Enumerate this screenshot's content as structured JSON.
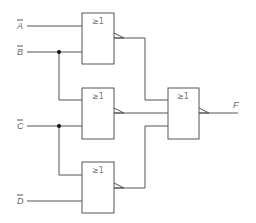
{
  "diagram": {
    "type": "logic-circuit",
    "inputs": [
      {
        "id": "A",
        "label": "A",
        "negated": true
      },
      {
        "id": "B",
        "label": "B",
        "negated": true
      },
      {
        "id": "C",
        "label": "C",
        "negated": true
      },
      {
        "id": "D",
        "label": "D",
        "negated": true
      }
    ],
    "gates": [
      {
        "id": "g1",
        "symbol": "≥1",
        "kind": "NOR",
        "inputs": [
          "A",
          "B"
        ]
      },
      {
        "id": "g2",
        "symbol": "≥1",
        "kind": "NOR",
        "inputs": [
          "B",
          "C"
        ]
      },
      {
        "id": "g3",
        "symbol": "≥1",
        "kind": "NOR",
        "inputs": [
          "C",
          "D"
        ]
      },
      {
        "id": "g4",
        "symbol": "≥1",
        "kind": "NOR",
        "inputs": [
          "g1",
          "g2",
          "g3"
        ]
      }
    ],
    "output": {
      "label": "F",
      "from": "g4"
    }
  }
}
